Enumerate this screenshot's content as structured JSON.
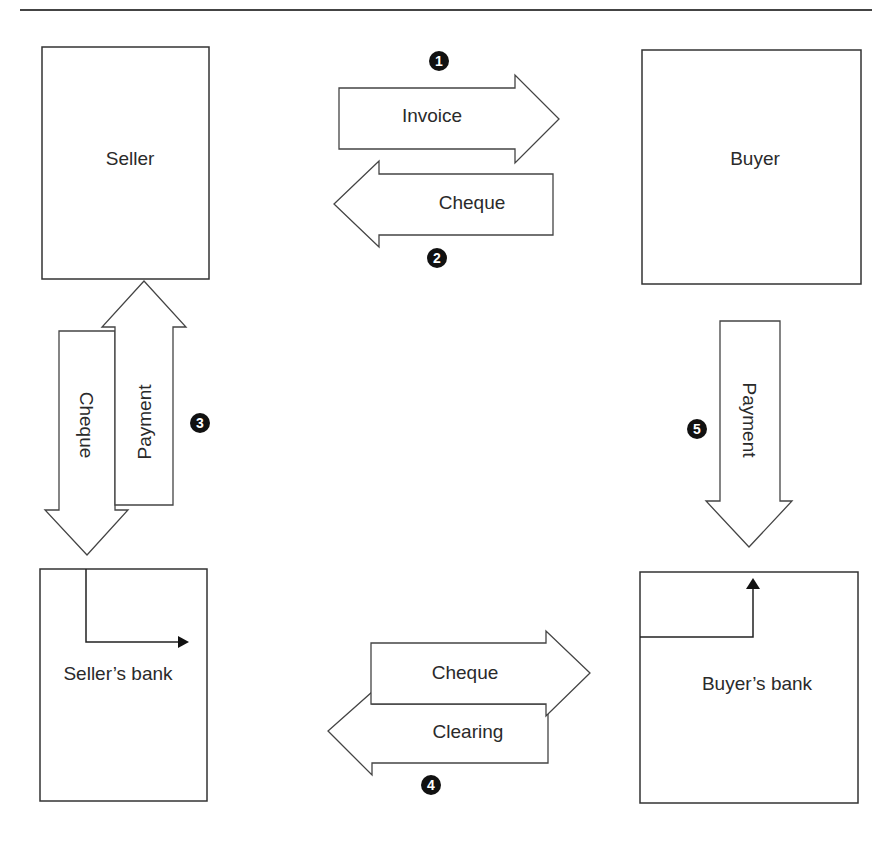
{
  "diagram": {
    "type": "payment-flow",
    "entities": {
      "seller": {
        "label": "Seller"
      },
      "buyer": {
        "label": "Buyer"
      },
      "seller_bank": {
        "label": "Seller’s bank"
      },
      "buyer_bank": {
        "label": "Buyer’s bank"
      }
    },
    "arrows": {
      "invoice": {
        "label": "Invoice",
        "from": "Seller",
        "to": "Buyer",
        "step": "1"
      },
      "cheque_to_seller": {
        "label": "Cheque",
        "from": "Buyer",
        "to": "Seller",
        "step": "2"
      },
      "cheque_to_seller_bank": {
        "label": "Cheque",
        "from": "Seller",
        "to": "Seller’s bank",
        "step": "3"
      },
      "payment_to_seller": {
        "label": "Payment",
        "from": "Seller’s bank",
        "to": "Seller",
        "step": "3"
      },
      "cheque_to_buyer_bank": {
        "label": "Cheque",
        "from": "Seller’s bank",
        "to": "Buyer’s bank",
        "step": "4"
      },
      "clearing": {
        "label": "Clearing",
        "from": "Buyer’s bank",
        "to": "Seller’s bank",
        "step": "4"
      },
      "payment_from_buyer": {
        "label": "Payment",
        "from": "Buyer",
        "to": "Buyer’s bank",
        "step": "5"
      }
    },
    "step_markers": [
      "1",
      "2",
      "3",
      "4",
      "5"
    ],
    "colors": {
      "line": "#333333",
      "marker_fill": "#111111",
      "background": "#ffffff"
    }
  }
}
